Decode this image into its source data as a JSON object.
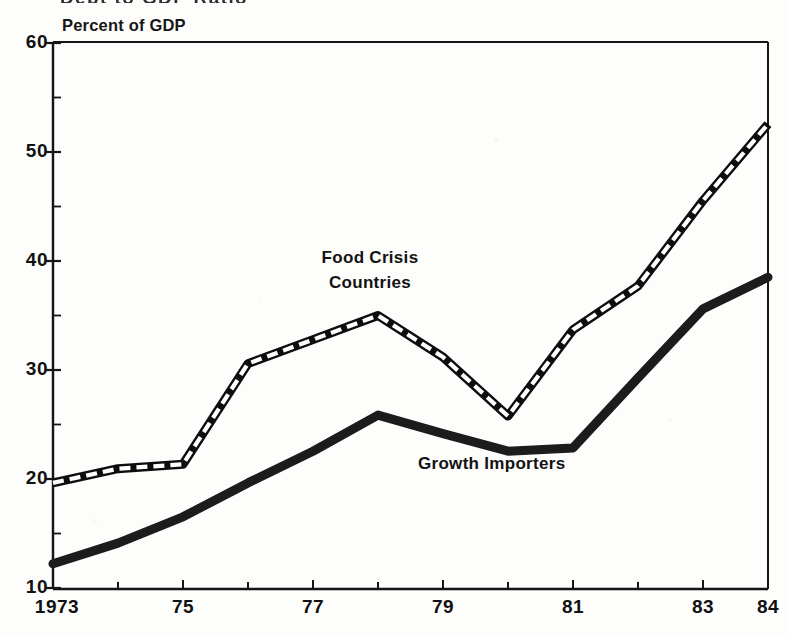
{
  "chart_data": {
    "type": "line",
    "title": "Debt to GDP Ratio",
    "subtitle": "",
    "ylabel": "Percent of GDP",
    "xlabel": "",
    "ylim": [
      10,
      60
    ],
    "xlim": [
      1973,
      1984
    ],
    "grid": false,
    "legend_position": "inline-annotation",
    "y_ticks": [
      60,
      50,
      40,
      30,
      20,
      10
    ],
    "y_minor_ticks": [
      55,
      45,
      35,
      25,
      15
    ],
    "x": [
      1973,
      1974,
      1975,
      1976,
      1977,
      1978,
      1979,
      1980,
      1981,
      1982,
      1983,
      1984
    ],
    "x_tick_labels": [
      "1973",
      "",
      "75",
      "",
      "77",
      "",
      "79",
      "",
      "81",
      "",
      "83",
      "84"
    ],
    "series": [
      {
        "name": "Food Crisis Countries",
        "style": "dashed-railroad",
        "color": "#101010",
        "values": [
          19.7,
          21.0,
          21.4,
          30.6,
          32.8,
          35.0,
          31.2,
          25.8,
          33.7,
          37.7,
          45.5,
          52.5
        ]
      },
      {
        "name": "Growth Importers",
        "style": "thick-solid",
        "color": "#1a1a1a",
        "values": [
          12.3,
          14.2,
          16.6,
          19.7,
          22.6,
          25.9,
          24.2,
          22.6,
          22.9,
          29.3,
          35.6,
          38.5
        ]
      }
    ],
    "annotations": [
      {
        "text": "Food Crisis\nCountries",
        "series": "Food Crisis Countries"
      },
      {
        "text": "Growth Importers",
        "series": "Growth Importers"
      }
    ]
  },
  "axis": {
    "caption": "Percent of GDP",
    "y_labels": [
      "60",
      "50",
      "40",
      "30",
      "20",
      "10"
    ],
    "x_labels": [
      "1973",
      "75",
      "77",
      "79",
      "81",
      "83",
      "84"
    ]
  },
  "labels": {
    "food_crisis": "Food Crisis\nCountries",
    "growth_importers": "Growth Importers"
  },
  "colors": {
    "ink": "#111111",
    "paper": "#fdfdfc"
  }
}
